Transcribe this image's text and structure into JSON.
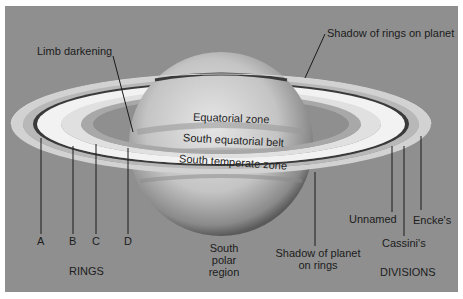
{
  "diagram": {
    "background_color": "#8f8f8f",
    "labels": {
      "limb_darkening": "Limb darkening",
      "shadow_rings_on_planet": "Shadow of rings on planet",
      "equatorial_zone": "Equatorial zone",
      "south_equatorial_belt": "South equatorial belt",
      "south_temperate_zone": "South temperate zone",
      "ring_a": "A",
      "ring_b": "B",
      "ring_c": "C",
      "ring_d": "D",
      "rings_heading": "RINGS",
      "south_polar_line1": "South",
      "south_polar_line2": "polar",
      "south_polar_line3": "region",
      "shadow_planet_line1": "Shadow of planet",
      "shadow_planet_line2": "on rings",
      "unnamed": "Unnamed",
      "cassini": "Cassini's",
      "encke": "Encke's",
      "divisions_heading": "DIVISIONS"
    }
  }
}
